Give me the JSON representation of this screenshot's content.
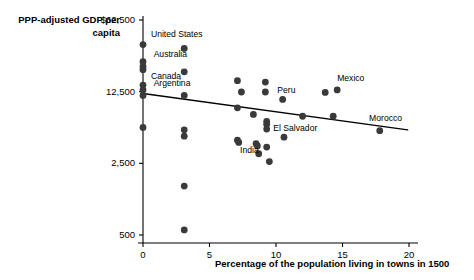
{
  "chart_data": {
    "type": "scatter",
    "title": "",
    "xlabel": "Percentage of the population living in towns in 1500",
    "ylabel": "PPP-adjusted GDP per capita",
    "xlim": [
      0,
      20
    ],
    "ylim": [
      500,
      62500
    ],
    "yscale": "log",
    "grid": false,
    "legend": null,
    "xticks": [
      "0",
      "5",
      "10",
      "15",
      "20"
    ],
    "xtick_values": [
      0,
      5,
      10,
      15,
      20
    ],
    "yticks": [
      "$62,500",
      "12,500",
      "2,500",
      "500"
    ],
    "ytick_values": [
      62500,
      12500,
      2500,
      500
    ],
    "points": [
      {
        "x": 0.0,
        "y": 36000,
        "label": "United States"
      },
      {
        "x": 0.0,
        "y": 24500,
        "label": "Australia"
      },
      {
        "x": 0.0,
        "y": 22000,
        "label": ""
      },
      {
        "x": 0.0,
        "y": 20500,
        "label": "Canada"
      },
      {
        "x": 0.0,
        "y": 14500,
        "label": "Argentina"
      },
      {
        "x": 0.0,
        "y": 13000,
        "label": ""
      },
      {
        "x": 0.0,
        "y": 11500,
        "label": ""
      },
      {
        "x": 0.0,
        "y": 5600,
        "label": ""
      },
      {
        "x": 3.1,
        "y": 33000,
        "label": ""
      },
      {
        "x": 3.1,
        "y": 19500,
        "label": ""
      },
      {
        "x": 3.1,
        "y": 11500,
        "label": ""
      },
      {
        "x": 3.1,
        "y": 5300,
        "label": ""
      },
      {
        "x": 3.1,
        "y": 4600,
        "label": ""
      },
      {
        "x": 3.1,
        "y": 1500,
        "label": ""
      },
      {
        "x": 3.1,
        "y": 560,
        "label": ""
      },
      {
        "x": 7.1,
        "y": 16000,
        "label": ""
      },
      {
        "x": 7.4,
        "y": 12400,
        "label": ""
      },
      {
        "x": 7.1,
        "y": 8700,
        "label": ""
      },
      {
        "x": 7.1,
        "y": 4200,
        "label": ""
      },
      {
        "x": 7.2,
        "y": 4000,
        "label": ""
      },
      {
        "x": 8.3,
        "y": 7500,
        "label": ""
      },
      {
        "x": 8.5,
        "y": 3900,
        "label": "India"
      },
      {
        "x": 8.6,
        "y": 3700,
        "label": ""
      },
      {
        "x": 8.7,
        "y": 3100,
        "label": ""
      },
      {
        "x": 9.2,
        "y": 15500,
        "label": ""
      },
      {
        "x": 9.2,
        "y": 12400,
        "label": ""
      },
      {
        "x": 9.3,
        "y": 6400,
        "label": ""
      },
      {
        "x": 9.3,
        "y": 6000,
        "label": ""
      },
      {
        "x": 9.3,
        "y": 5400,
        "label": "El Salvador"
      },
      {
        "x": 9.3,
        "y": 3600,
        "label": ""
      },
      {
        "x": 9.5,
        "y": 2600,
        "label": ""
      },
      {
        "x": 10.5,
        "y": 10500,
        "label": "Peru"
      },
      {
        "x": 10.6,
        "y": 4500,
        "label": ""
      },
      {
        "x": 12.0,
        "y": 7200,
        "label": ""
      },
      {
        "x": 13.7,
        "y": 12300,
        "label": ""
      },
      {
        "x": 14.6,
        "y": 13000,
        "label": "Mexico"
      },
      {
        "x": 14.3,
        "y": 7200,
        "label": ""
      },
      {
        "x": 17.8,
        "y": 5200,
        "label": "Morocco"
      }
    ],
    "trendline": {
      "x0": 0.0,
      "y0": 12000,
      "x1": 19.9,
      "y1": 5300,
      "description": "negative sloping fitted regression line"
    },
    "annotations": [
      {
        "text": "United States",
        "x": 0.6,
        "y": 45000
      },
      {
        "text": "Australia",
        "x": 0.8,
        "y": 28500
      },
      {
        "text": "Canada",
        "x": 0.6,
        "y": 17500
      },
      {
        "text": "Argentina",
        "x": 0.8,
        "y": 14800
      },
      {
        "text": "Peru",
        "x": 10.1,
        "y": 12600
      },
      {
        "text": "El Salvador",
        "x": 9.8,
        "y": 5400
      },
      {
        "text": "India",
        "x": 7.3,
        "y": 3300
      },
      {
        "text": "Mexico",
        "x": 14.6,
        "y": 16500
      },
      {
        "text": "Morocco",
        "x": 17.0,
        "y": 6700
      }
    ],
    "colors": {
      "point": "#3a3a3a",
      "axis": "#000000",
      "trendline": "#000000",
      "background": "#ffffff"
    }
  }
}
